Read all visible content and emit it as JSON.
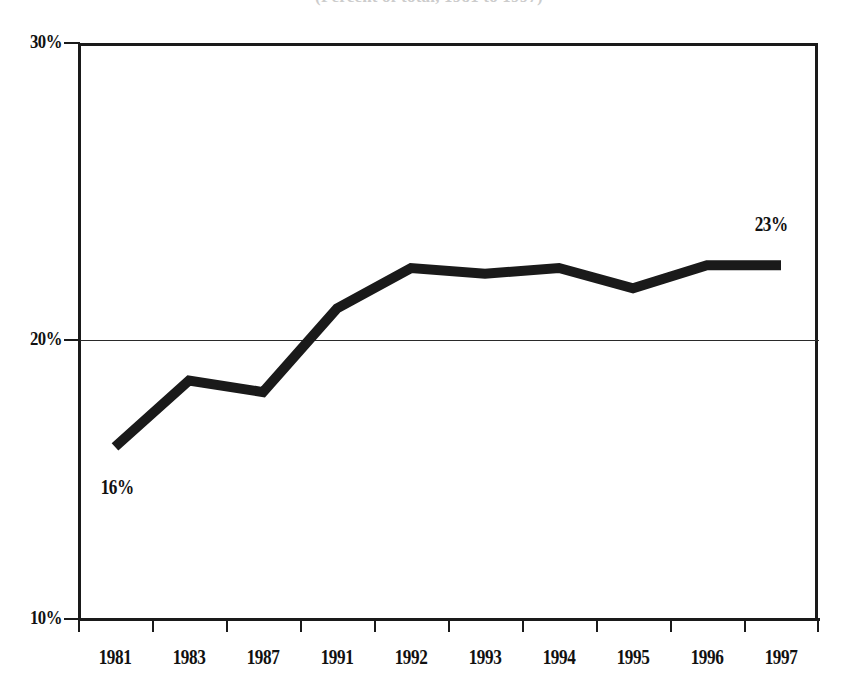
{
  "title": {
    "text": "(Percent of total, 1981 to 1997)",
    "visible_fragment": ", 1981 to 1997)",
    "note": "cropped at top edge of image"
  },
  "chart_data": {
    "type": "line",
    "title": "(Percent of total, 1981 to 1997)",
    "xlabel": "",
    "ylabel": "",
    "categories": [
      "1981",
      "1983",
      "1987",
      "1991",
      "1992",
      "1993",
      "1994",
      "1995",
      "1996",
      "1997"
    ],
    "values": [
      16.0,
      18.3,
      17.9,
      20.8,
      22.2,
      22.0,
      22.2,
      21.5,
      22.3,
      22.3
    ],
    "ylim": [
      10,
      30
    ],
    "yticks": [
      10,
      20,
      30
    ],
    "ytick_labels": [
      "10%",
      "20%",
      "30%"
    ],
    "grid": "horizontal-at-20-only",
    "legend": "none",
    "line_color": "#1a1a1a",
    "line_width_px": 10,
    "annotations": [
      {
        "label": "16%",
        "category": "1981",
        "value": 16.0,
        "position": "below-left"
      },
      {
        "label": "23%",
        "category": "1997",
        "value": 22.3,
        "position": "above"
      }
    ]
  },
  "axes": {
    "y_labels": [
      "30%",
      "20%",
      "10%"
    ],
    "x_labels": [
      "1981",
      "1983",
      "1987",
      "1991",
      "1992",
      "1993",
      "1994",
      "1995",
      "1996",
      "1997"
    ]
  },
  "colors": {
    "line": "#1a1a1a",
    "axis": "#1a1a1a",
    "grid": "#2a2a2a",
    "text": "#111111",
    "background": "#ffffff"
  }
}
